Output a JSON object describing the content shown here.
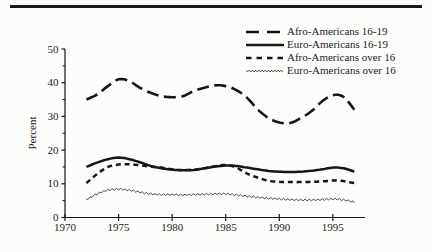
{
  "figure": {
    "top_rule_color": "#1a1a1a",
    "line_color": "#161616",
    "background": "#fcfcfa"
  },
  "chart_data": {
    "type": "line",
    "title": "",
    "xlabel": "",
    "ylabel": "Percent",
    "xlim": [
      1970,
      1998
    ],
    "ylim": [
      0,
      50
    ],
    "x_ticks": [
      1970,
      1975,
      1980,
      1985,
      1990,
      1995
    ],
    "y_ticks": [
      0,
      10,
      20,
      30,
      40,
      50
    ],
    "y_minor_ticks": [
      5,
      15,
      25,
      35,
      45
    ],
    "grid": false,
    "legend_position": "top-right",
    "years": [
      1972,
      1973,
      1974,
      1975,
      1976,
      1977,
      1978,
      1979,
      1980,
      1981,
      1982,
      1983,
      1984,
      1985,
      1986,
      1987,
      1988,
      1989,
      1990,
      1991,
      1992,
      1993,
      1994,
      1995,
      1996,
      1997
    ],
    "series": [
      {
        "name": "Afro-Americans 16-19",
        "style": "long-dash",
        "values": [
          35,
          36.5,
          39,
          41,
          40.5,
          38.5,
          37,
          36,
          35.7,
          36,
          37.5,
          38.5,
          39.2,
          39,
          37.8,
          35.5,
          32,
          29.5,
          28.2,
          28,
          29.5,
          31.5,
          34.5,
          36.3,
          35.8,
          32
        ]
      },
      {
        "name": "Euro-Americans 16-19",
        "style": "solid",
        "values": [
          15,
          16.3,
          17.3,
          17.8,
          17.3,
          16.4,
          15.3,
          14.6,
          14.2,
          14,
          14.1,
          14.6,
          15.1,
          15.4,
          15.3,
          14.8,
          14.3,
          13.8,
          13.6,
          13.5,
          13.6,
          13.9,
          14.3,
          14.8,
          14.6,
          13.6
        ]
      },
      {
        "name": "Afro-Americans over 16",
        "style": "short-dash",
        "values": [
          10.2,
          12.9,
          15,
          15.7,
          15.8,
          15.5,
          15.1,
          14.8,
          14.3,
          14.1,
          14.2,
          14.6,
          15.2,
          15.6,
          14.8,
          13,
          11.8,
          10.9,
          10.6,
          10.5,
          10.5,
          10.6,
          10.7,
          11,
          10.8,
          10.2
        ]
      },
      {
        "name": "Euro-Americans over 16",
        "style": "fine-zigzag",
        "values": [
          5.3,
          7,
          8.1,
          8.4,
          8.1,
          7.5,
          7,
          6.8,
          6.8,
          6.7,
          6.8,
          6.9,
          7,
          7,
          6.7,
          6.3,
          6,
          5.7,
          5.5,
          5.3,
          5.2,
          5.2,
          5.3,
          5.5,
          5.2,
          4.6
        ]
      }
    ]
  }
}
